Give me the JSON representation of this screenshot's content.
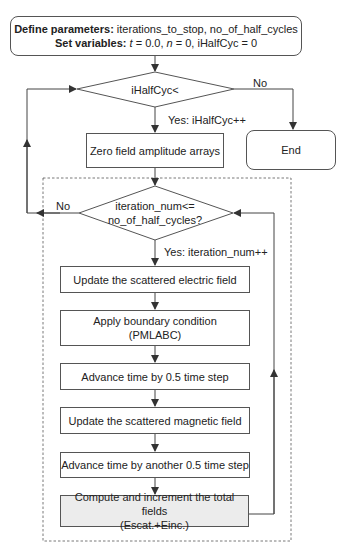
{
  "start": {
    "line1_bold": "Define parameters:",
    "line1_text": " iterations_to_stop, no_of_half_cycles",
    "line2_bold": "Set variables:",
    "line2_t": "t",
    "line2_a": " = 0.0, ",
    "line2_n": "n",
    "line2_b": " = 0, iHalfCyc = 0"
  },
  "decision1": {
    "text": "iHalfCyc<",
    "yes_label": "Yes: iHalfCyc++",
    "no_label": "No"
  },
  "end": {
    "text": "End"
  },
  "zero_box": {
    "text": "Zero field amplitude arrays"
  },
  "decision2": {
    "line1": "iteration_num<=",
    "line2": "no_of_half_cycles?",
    "yes_label": "Yes: iteration_num++",
    "no_label": "No"
  },
  "steps": [
    {
      "line1": "Update the scattered electric field",
      "line2": ""
    },
    {
      "line1": "Apply boundary condition",
      "line2": "(PMLABC)"
    },
    {
      "line1": "Advance time by 0.5 time step",
      "line2": ""
    },
    {
      "line1": "Update the scattered magnetic field",
      "line2": ""
    },
    {
      "line1": "Advance time by another 0.5 time step",
      "line2": ""
    },
    {
      "line1": "Compute and increment the total fields",
      "line2": "(Escat.+Einc.)"
    }
  ],
  "colors": {
    "line": "#444444",
    "box_border": "#555555",
    "highlight_fill": "#ececec"
  }
}
